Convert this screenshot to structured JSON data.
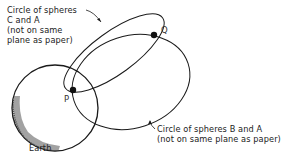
{
  "diagram": {
    "labels": {
      "circle_ca": {
        "line1": "Circle of spheres",
        "line2": "C and A",
        "line3": "(not on same",
        "line4": "plane as paper)"
      },
      "circle_ba": {
        "line1": "Circle of spheres B and A",
        "line2": "(not on same plane as paper)"
      },
      "earth": "Earth",
      "point_p": "P",
      "point_q": "Q"
    },
    "colors": {
      "stroke": "#1a1a1a",
      "text": "#222222",
      "background": "#ffffff"
    }
  }
}
